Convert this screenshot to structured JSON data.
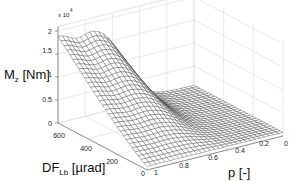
{
  "chart_data": {
    "type": "surface",
    "title": "",
    "xlabel": "p [-]",
    "ylabel": "DF_Lb [µrad]",
    "zlabel": "M_z [Nm]",
    "zlabel_main": "M",
    "zlabel_sub": "z",
    "zlabel_unit": " [Nm]",
    "ylabel_main": "DF",
    "ylabel_sub": "Lb",
    "ylabel_unit": " [µrad]",
    "z_multiplier": "x 10",
    "z_multiplier_exp": "4",
    "x_ticks": [
      "0",
      "0.2",
      "0.4",
      "0.6",
      "0.8",
      "1"
    ],
    "x_range": [
      0,
      1
    ],
    "y_ticks": [
      "0",
      "200",
      "400",
      "600"
    ],
    "y_range": [
      0,
      600
    ],
    "z_ticks": [
      "0",
      "0.5",
      "1",
      "1.5",
      "2"
    ],
    "z_range": [
      0,
      2
    ],
    "grid": true,
    "mesh_color": "#333333",
    "surface_fill": "#ffffff",
    "surface_description": "Mz is approx 0.1e4 at p<=0.3 for all DF; rises steeply between p=0.4 and p=0.7; for large DF (600) plateaus near 1.8-1.9e4 at p=0.7-1 with a slight dip near p~0.85; at DF=0 remains low",
    "sample_points": [
      {
        "p": 1.0,
        "DF": 600,
        "Mz": 1.9
      },
      {
        "p": 0.85,
        "DF": 600,
        "Mz": 1.75
      },
      {
        "p": 0.7,
        "DF": 600,
        "Mz": 1.85
      },
      {
        "p": 0.55,
        "DF": 600,
        "Mz": 1.2
      },
      {
        "p": 0.4,
        "DF": 600,
        "Mz": 0.3
      },
      {
        "p": 0.2,
        "DF": 600,
        "Mz": 0.1
      },
      {
        "p": 0.0,
        "DF": 600,
        "Mz": 0.1
      },
      {
        "p": 1.0,
        "DF": 300,
        "Mz": 0.9
      },
      {
        "p": 0.6,
        "DF": 300,
        "Mz": 0.7
      },
      {
        "p": 0.2,
        "DF": 300,
        "Mz": 0.1
      },
      {
        "p": 1.0,
        "DF": 0,
        "Mz": 0.05
      },
      {
        "p": 0.0,
        "DF": 0,
        "Mz": 0.05
      }
    ]
  }
}
